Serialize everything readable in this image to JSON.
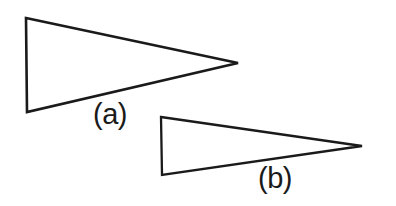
{
  "figure": {
    "background_color": "#ffffff",
    "line_color": "#1a1a1a",
    "width": 396,
    "height": 206
  },
  "shapes": [
    {
      "id": "triangle-a",
      "name": "triangle-a",
      "label": "(a)",
      "points": "26,18 238,63 27,112",
      "stroke_width": 2.6,
      "stroke_color": "#1a1a1a",
      "fill": "none",
      "vertices": [
        {
          "x": 26,
          "y": 18,
          "role": "top-left"
        },
        {
          "x": 238,
          "y": 63,
          "role": "apex-right"
        },
        {
          "x": 27,
          "y": 112,
          "role": "bottom-left"
        }
      ],
      "base_height": 94,
      "length": 212
    },
    {
      "id": "triangle-b",
      "name": "triangle-b",
      "label": "(b)",
      "points": "161,117 362,146 162,175",
      "stroke_width": 2.3,
      "stroke_color": "#1a1a1a",
      "fill": "none",
      "vertices": [
        {
          "x": 161,
          "y": 117,
          "role": "top-left"
        },
        {
          "x": 362,
          "y": 146,
          "role": "apex-right"
        },
        {
          "x": 162,
          "y": 175,
          "role": "bottom-left"
        }
      ],
      "base_height": 58,
      "length": 201
    }
  ],
  "labels": {
    "a": "(a)",
    "b": "(b)"
  }
}
